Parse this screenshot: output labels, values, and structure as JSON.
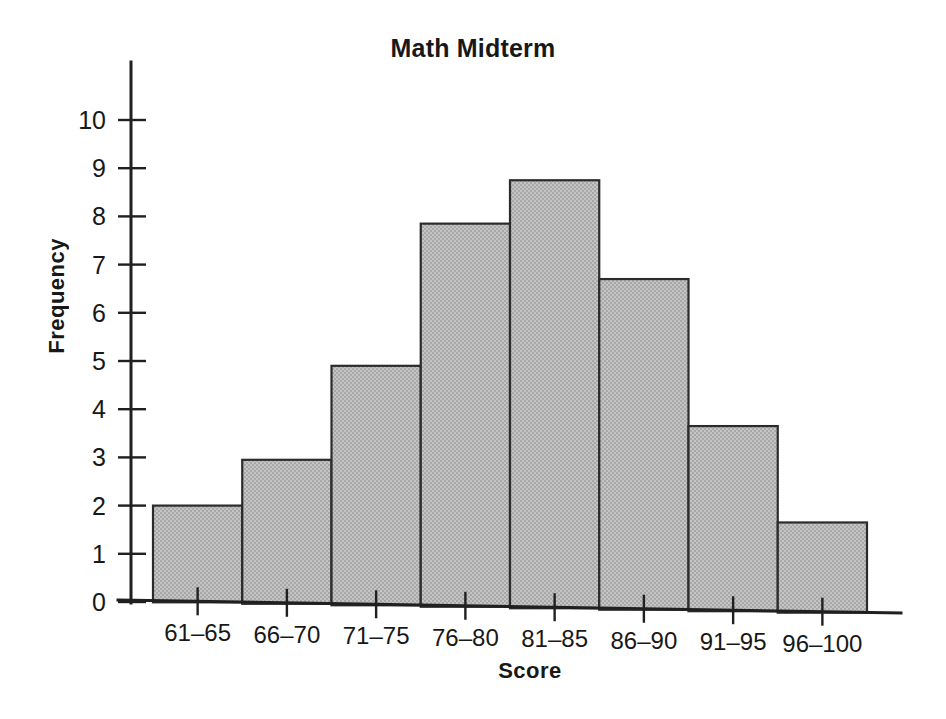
{
  "chart_data": {
    "type": "bar",
    "title": "Math Midterm",
    "xlabel": "Score",
    "ylabel": "Frequency",
    "categories": [
      "61–65",
      "66–70",
      "71–75",
      "76–80",
      "81–85",
      "86–90",
      "91–95",
      "96–100"
    ],
    "values": [
      2.0,
      2.95,
      4.9,
      7.85,
      8.75,
      6.7,
      3.65,
      1.65
    ],
    "ylim": [
      0,
      10
    ],
    "yticks": [
      0,
      1,
      2,
      3,
      4,
      5,
      6,
      7,
      8,
      9,
      10
    ],
    "ytick_labels": [
      "0",
      "1",
      "2",
      "3",
      "4",
      "5",
      "6",
      "7",
      "8",
      "9",
      "10"
    ],
    "grid": false,
    "legend": null,
    "bar_fill_color": "#b9b9b9",
    "bar_edge_color": "#2b2b2b",
    "axis_color": "#202020",
    "text_color": "#181818",
    "background_color": "#ffffff"
  }
}
